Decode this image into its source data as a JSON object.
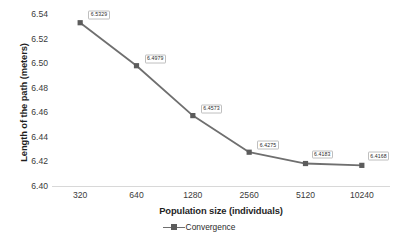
{
  "chart_data": {
    "type": "line",
    "title": "",
    "xlabel": "Population size (individuals)",
    "ylabel": "Length of the path (meters)",
    "categories": [
      "320",
      "640",
      "1280",
      "2560",
      "5120",
      "10240"
    ],
    "series": [
      {
        "name": "Convergence",
        "values": [
          6.5329,
          6.4979,
          6.4573,
          6.4275,
          6.4183,
          6.4168
        ],
        "point_labels": [
          "6.5329",
          "6.4979",
          "6.4573",
          "6.4275",
          "6.4183",
          "6.4168"
        ],
        "line_color": "#6f6f6f",
        "marker_color": "#5c5c5c",
        "marker_shape": "square"
      }
    ],
    "ylim": [
      6.4,
      6.54
    ],
    "ytick_labels": [
      "6.54",
      "6.52",
      "6.50",
      "6.48",
      "6.46",
      "6.44",
      "6.42",
      "6.40"
    ],
    "ytick_values": [
      6.54,
      6.52,
      6.5,
      6.48,
      6.46,
      6.44,
      6.42,
      6.4
    ],
    "grid": false,
    "legend_position": "bottom",
    "background_color": "#ffffff",
    "axis_line_color": "#d8d8d8"
  },
  "legend": {
    "items": [
      {
        "label": "Convergence"
      }
    ]
  }
}
